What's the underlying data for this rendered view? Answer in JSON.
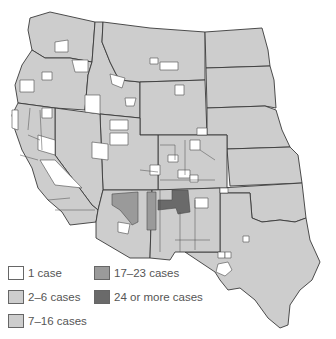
{
  "map": {
    "region": "Western United States",
    "colors": {
      "one_case": "#ffffff",
      "two_to_six": "#cdcdcd",
      "seven_to_sixteen": "#cdcdcd",
      "seventeen_to_twentythree": "#9a9a9a",
      "twentyfour_plus": "#6a6a6a",
      "border": "#3a3a3a"
    }
  },
  "legend": {
    "items": [
      {
        "label": "1 case",
        "color": "#ffffff"
      },
      {
        "label": "2–6 cases",
        "color": "#cdcdcd"
      },
      {
        "label": "7–16 cases",
        "color": "#cdcdcd"
      },
      {
        "label": "17–23 cases",
        "color": "#9a9a9a"
      },
      {
        "label": "24 or more cases",
        "color": "#6a6a6a"
      }
    ]
  }
}
